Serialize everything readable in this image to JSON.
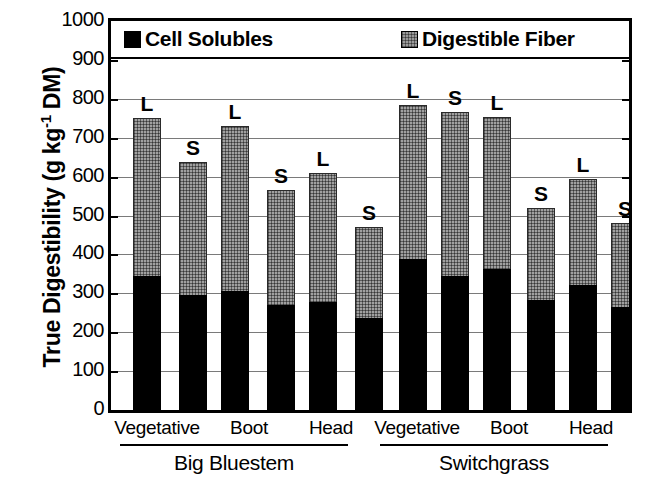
{
  "chart_data": {
    "type": "bar",
    "subtype": "stacked-grouped",
    "title": "",
    "xlabel": "",
    "ylabel": "True Digestibility (g kg-1 DM)",
    "ylabel_parts": {
      "main": "True Digestibility (g kg",
      "sup": "-1",
      "tail": " DM)"
    },
    "ylim": [
      0,
      1000
    ],
    "ytick_step": 100,
    "yticks": [
      1000,
      900,
      800,
      700,
      600,
      500,
      400,
      300,
      200,
      100,
      0
    ],
    "grid": true,
    "legend_position": "top-inside",
    "legend": [
      {
        "name": "Cell Solubles",
        "swatch": "solid-black",
        "color": "#000000"
      },
      {
        "name": "Digestible Fiber",
        "swatch": "gray-crosshatch",
        "color": "#9a9a9a"
      }
    ],
    "series": [
      {
        "name": "Cell Solubles",
        "color": "#000000"
      },
      {
        "name": "Digestible Fiber",
        "color": "#9a9a9a"
      }
    ],
    "groups": [
      "Big Bluestem",
      "Switchgrass"
    ],
    "categories": [
      "Vegetative",
      "Boot",
      "Head"
    ],
    "bar_labels": [
      "L",
      "S"
    ],
    "bar_label_meaning": {
      "L": "L",
      "S": "S"
    },
    "bars": [
      {
        "group": "Big Bluestem",
        "category": "Vegetative",
        "label": "L",
        "cell_solubles": 348,
        "digestible_fiber": 402,
        "total": 750
      },
      {
        "group": "Big Bluestem",
        "category": "Vegetative",
        "label": "S",
        "cell_solubles": 297,
        "digestible_fiber": 340,
        "total": 637
      },
      {
        "group": "Big Bluestem",
        "category": "Boot",
        "label": "L",
        "cell_solubles": 308,
        "digestible_fiber": 422,
        "total": 730
      },
      {
        "group": "Big Bluestem",
        "category": "Boot",
        "label": "S",
        "cell_solubles": 272,
        "digestible_fiber": 293,
        "total": 565
      },
      {
        "group": "Big Bluestem",
        "category": "Head",
        "label": "L",
        "cell_solubles": 280,
        "digestible_fiber": 330,
        "total": 610
      },
      {
        "group": "Big Bluestem",
        "category": "Head",
        "label": "S",
        "cell_solubles": 240,
        "digestible_fiber": 230,
        "total": 470
      },
      {
        "group": "Switchgrass",
        "category": "Vegetative",
        "label": "L",
        "cell_solubles": 392,
        "digestible_fiber": 393,
        "total": 785
      },
      {
        "group": "Switchgrass",
        "category": "Vegetative",
        "label": "S",
        "cell_solubles": 347,
        "digestible_fiber": 418,
        "total": 765
      },
      {
        "group": "Switchgrass",
        "category": "Boot",
        "label": "L",
        "cell_solubles": 365,
        "digestible_fiber": 387,
        "total": 752
      },
      {
        "group": "Switchgrass",
        "category": "Boot",
        "label": "S",
        "cell_solubles": 285,
        "digestible_fiber": 235,
        "total": 520
      },
      {
        "group": "Switchgrass",
        "category": "Head",
        "label": "L",
        "cell_solubles": 325,
        "digestible_fiber": 270,
        "total": 595
      },
      {
        "group": "Switchgrass",
        "category": "Head",
        "label": "S",
        "cell_solubles": 268,
        "digestible_fiber": 212,
        "total": 480
      }
    ]
  },
  "axis": {
    "y_title_main": "True Digestibility (g kg",
    "y_title_sup": "-1",
    "y_title_tail": " DM)",
    "tick_labels": [
      "1000",
      "900",
      "800",
      "700",
      "600",
      "500",
      "400",
      "300",
      "200",
      "100",
      "0"
    ]
  },
  "legend": {
    "solubles_label": "Cell Solubles",
    "fiber_label": "Digestible Fiber"
  },
  "category_labels": {
    "bb_vegetative": "Vegetative",
    "bb_boot": "Boot",
    "bb_head": "Head",
    "sg_vegetative": "Vegetative",
    "sg_boot": "Boot",
    "sg_head": "Head"
  },
  "group_labels": {
    "big_bluestem": "Big Bluestem",
    "switchgrass": "Switchgrass"
  }
}
